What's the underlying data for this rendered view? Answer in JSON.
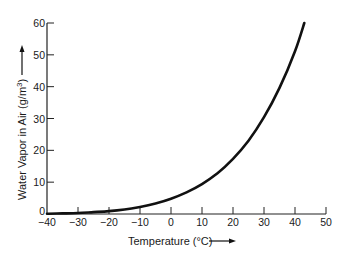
{
  "chart_data": {
    "type": "line",
    "title": "",
    "xlabel": "Temperature (°C)",
    "ylabel": "Water Vapor in Air (g/m³)",
    "xlim": [
      -40,
      50
    ],
    "ylim": [
      0,
      60
    ],
    "x_ticks": [
      -40,
      -30,
      -20,
      -10,
      0,
      10,
      20,
      30,
      40,
      50
    ],
    "x_tick_labels": [
      "−40",
      "−30",
      "−20",
      "−10",
      "0",
      "10",
      "20",
      "30",
      "40",
      "50"
    ],
    "y_ticks": [
      0,
      10,
      20,
      30,
      40,
      50,
      60
    ],
    "y_tick_labels": [
      "0",
      "10",
      "20",
      "30",
      "40",
      "50",
      "60"
    ],
    "grid": false,
    "legend": null,
    "series": [
      {
        "name": "Saturation water vapor content",
        "x": [
          -40,
          -35,
          -30,
          -25,
          -20,
          -15,
          -10,
          -5,
          0,
          5,
          10,
          15,
          20,
          25,
          30,
          35,
          40,
          43
        ],
        "values": [
          0.1,
          0.2,
          0.3,
          0.6,
          0.9,
          1.4,
          2.2,
          3.3,
          4.8,
          6.8,
          9.4,
          12.8,
          17.3,
          23.0,
          30.4,
          39.6,
          51.1,
          60.0
        ]
      }
    ]
  },
  "axis_labels": {
    "x": "Temperature (°C)",
    "y": "Water Vapor in Air (g/m³)"
  }
}
